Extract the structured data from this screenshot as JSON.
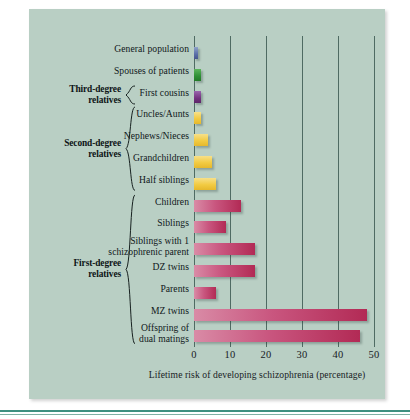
{
  "figure": {
    "panel_color": "#b9cfc4",
    "rule_color": "#3f8f80"
  },
  "chart_data": {
    "type": "bar",
    "orientation": "horizontal",
    "title": "",
    "xlabel": "Lifetime risk of developing schizophrenia (percentage)",
    "ylabel": "",
    "xlim": [
      0,
      50
    ],
    "xticks": [
      0,
      10,
      20,
      30,
      40,
      50
    ],
    "xtick_labels": [
      "0",
      "10",
      "20",
      "30",
      "40",
      "50"
    ],
    "grid": true,
    "grid_axis": "x",
    "legend": "none",
    "categories": [
      "General population",
      "Spouses of patients",
      "First cousins",
      "Uncles/Aunts",
      "Nephews/Nieces",
      "Grandchildren",
      "Half siblings",
      "Children",
      "Siblings",
      "Siblings with 1 schizophrenic parent",
      "DZ twins",
      "Parents",
      "MZ twins",
      "Offspring of dual matings"
    ],
    "values": [
      1,
      2,
      2,
      2,
      4,
      5,
      6,
      13,
      9,
      17,
      17,
      6,
      48,
      46
    ],
    "bar_colors": [
      "#46558c",
      "#227a28",
      "#5d2668",
      "#e6b82c",
      "#e6b82c",
      "#e6b82c",
      "#e6b82c",
      "#b22a55",
      "#b22a55",
      "#b22a55",
      "#b22a55",
      "#b22a55",
      "#b22a55",
      "#b22a55"
    ]
  },
  "rows": [
    {
      "label": "General population",
      "value": 1,
      "color_class": "blue",
      "lines": 1
    },
    {
      "label": "Spouses of patients",
      "value": 2,
      "color_class": "green",
      "lines": 1
    },
    {
      "label": "First cousins",
      "value": 2,
      "color_class": "purple",
      "lines": 1
    },
    {
      "label": "Uncles/Aunts",
      "value": 2,
      "color_class": "gold",
      "lines": 1
    },
    {
      "label": "Nephews/Nieces",
      "value": 4,
      "color_class": "gold",
      "lines": 1
    },
    {
      "label": "Grandchildren",
      "value": 5,
      "color_class": "gold",
      "lines": 1
    },
    {
      "label": "Half siblings",
      "value": 6,
      "color_class": "gold",
      "lines": 1
    },
    {
      "label": "Children",
      "value": 13,
      "color_class": "crimson",
      "lines": 1
    },
    {
      "label": "Siblings",
      "value": 9,
      "color_class": "crimson",
      "lines": 1
    },
    {
      "label": "Siblings with 1\nschizophrenic parent",
      "value": 17,
      "color_class": "crimson",
      "lines": 2
    },
    {
      "label": "DZ twins",
      "value": 17,
      "color_class": "crimson",
      "lines": 1
    },
    {
      "label": "Parents",
      "value": 6,
      "color_class": "crimson",
      "lines": 1
    },
    {
      "label": "MZ twins",
      "value": 48,
      "color_class": "crimson",
      "lines": 1
    },
    {
      "label": "Offspring of\ndual matings",
      "value": 46,
      "color_class": "crimson",
      "lines": 2
    }
  ],
  "groups": [
    {
      "label": "Third-degree\nrelatives",
      "first_row": 2,
      "last_row": 2
    },
    {
      "label": "Second-degree\nrelatives",
      "first_row": 3,
      "last_row": 6
    },
    {
      "label": "First-degree\nrelatives",
      "first_row": 7,
      "last_row": 13
    }
  ],
  "axis": {
    "title": "Lifetime risk of developing schizophrenia (percentage)",
    "ticks": [
      "0",
      "10",
      "20",
      "30",
      "40",
      "50"
    ]
  }
}
